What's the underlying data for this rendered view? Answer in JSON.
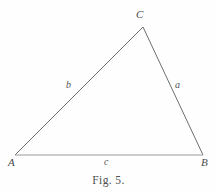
{
  "figure": {
    "caption": "Fig. 5.",
    "background_color": "#fefefe",
    "stroke_color": "#6e6e6e",
    "base_stroke_color": "#9a9a9a",
    "text_color": "#4a4a4a"
  },
  "diagram": {
    "type": "triangle",
    "vertices": [
      {
        "id": "A",
        "label": "A",
        "x": 15,
        "y": 155
      },
      {
        "id": "B",
        "label": "B",
        "x": 203,
        "y": 155
      },
      {
        "id": "C",
        "label": "C",
        "x": 143,
        "y": 27
      }
    ],
    "sides": [
      {
        "id": "a",
        "label": "a",
        "from": "C",
        "to": "B",
        "label_x": 175,
        "label_y": 80
      },
      {
        "id": "b",
        "label": "b",
        "from": "A",
        "to": "C",
        "label_x": 66,
        "label_y": 80
      },
      {
        "id": "c",
        "label": "c",
        "from": "A",
        "to": "B",
        "label_x": 104,
        "label_y": 157
      }
    ]
  }
}
